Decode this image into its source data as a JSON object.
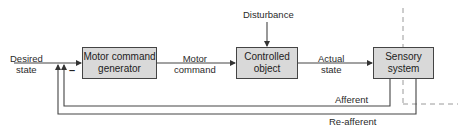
{
  "diagram": {
    "type": "feedback-control-block-diagram",
    "blocks": [
      {
        "id": "motor_command_generator",
        "label": "Motor command\ngenerator"
      },
      {
        "id": "controlled_object",
        "label": "Controlled\nobject"
      },
      {
        "id": "sensory_system",
        "label": "Sensory\nsystem"
      }
    ],
    "signals": {
      "input": "Desired\nstate",
      "motor_command": "Motor\ncommand",
      "actual_state": "Actual\nstate",
      "disturbance": "Disturbance",
      "afferent": "Afferent",
      "reafferent": "Re-afferent"
    },
    "summing_sign": "–",
    "colors": {
      "block_fill": "#d9d9d9",
      "line": "#444444",
      "dashed": "#999999"
    }
  }
}
